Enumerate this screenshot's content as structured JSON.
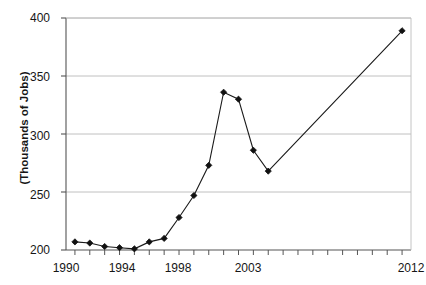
{
  "chart_data": {
    "type": "line",
    "title": "",
    "xlabel": "",
    "ylabel": "(Thousands of Jobs)",
    "xlim": [
      1989.4,
      2012.6
    ],
    "ylim": [
      200,
      400
    ],
    "grid": true,
    "legend": false,
    "y_ticks": [
      200,
      250,
      300,
      350,
      400
    ],
    "x_ticks": [
      1990,
      1994,
      1998,
      2003,
      2012
    ],
    "x_tick_labels": [
      "1990",
      "1994",
      "1998",
      "2003",
      "2012"
    ],
    "y_tick_labels": [
      "200",
      "250",
      "300",
      "350",
      "400"
    ],
    "marker": "diamond",
    "line_color": "#1a1a1a",
    "marker_color": "#111111",
    "grid_color": "#b9b9b9",
    "axis_color": "#6b6b6b",
    "x": [
      1990,
      1991,
      1992,
      1993,
      1994,
      1995,
      1996,
      1997,
      1998,
      1999,
      2000,
      2001,
      2002,
      2003,
      2012
    ],
    "values": [
      207,
      206,
      203,
      202,
      201,
      207,
      210,
      228,
      247,
      273,
      336,
      330,
      286,
      268,
      389
    ],
    "series": [
      {
        "name": "Jobs",
        "x": [
          1990,
          1991,
          1992,
          1993,
          1994,
          1995,
          1996,
          1997,
          1998,
          1999,
          2000,
          2001,
          2002,
          2003,
          2012
        ],
        "values": [
          207,
          206,
          203,
          202,
          201,
          207,
          210,
          228,
          247,
          273,
          336,
          330,
          286,
          268,
          389
        ]
      }
    ]
  },
  "axes": {
    "y_title": "(Thousands of Jobs)",
    "y_labels": {
      "t400": "400",
      "t350": "350",
      "t300": "300",
      "t250": "250",
      "t200": "200"
    },
    "x_labels": {
      "t1990": "1990",
      "t1994": "1994",
      "t1998": "1998",
      "t2003": "2003",
      "t2012": "2012"
    }
  },
  "header": {
    "title": ""
  }
}
